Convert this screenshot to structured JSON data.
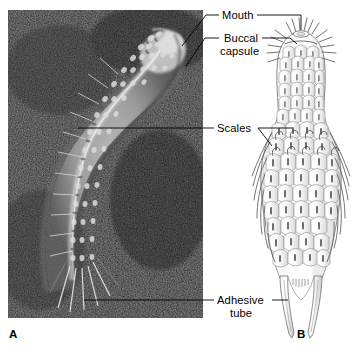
{
  "figure": {
    "panels": [
      {
        "id": "A",
        "label": "A",
        "kind": "photomicrograph",
        "description": "dark-field light micrograph of a curved loricate animal"
      },
      {
        "id": "B",
        "label": "B",
        "kind": "line-drawing",
        "description": "dorsal view line drawing of the same animal showing scales and adhesive tubes"
      }
    ],
    "callouts": [
      {
        "key": "mouth",
        "text": "Mouth",
        "lines": [
          "Mouth"
        ],
        "target_panels": [
          "A",
          "B"
        ]
      },
      {
        "key": "buccal_capsule",
        "text": "Buccal capsule",
        "lines": [
          "Buccal",
          "capsule"
        ],
        "target_panels": [
          "A",
          "B"
        ]
      },
      {
        "key": "scales",
        "text": "Scales",
        "lines": [
          "Scales"
        ],
        "target_panels": [
          "A",
          "B"
        ]
      },
      {
        "key": "adhesive_tube",
        "text": "Adhesive tube",
        "lines": [
          "Adhesive",
          "tube"
        ],
        "target_panels": [
          "A",
          "B"
        ]
      }
    ],
    "colors": {
      "background": "#ffffff",
      "photo_dark": "#141414",
      "photo_specimen": "#b9b9b9",
      "ink_line": "#6e6e6e",
      "text": "#000000"
    }
  }
}
